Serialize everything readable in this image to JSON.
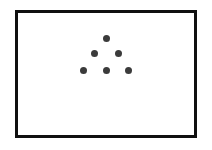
{
  "figure": {
    "background_color": "#ffffff",
    "frame": {
      "border_color": "#101010",
      "border_width_px": 3,
      "x": 15,
      "y": 10,
      "width": 182,
      "height": 128,
      "fill_color": "#ffffff"
    },
    "dot_color": "#3b3b3b",
    "dot_diameter_px": 7,
    "dot_count": 6,
    "rows": [
      {
        "label": "top-row",
        "count": 1
      },
      {
        "label": "middle-row",
        "count": 2
      },
      {
        "label": "bottom-row",
        "count": 3
      }
    ],
    "dots": [
      {
        "id": "dot-1",
        "row": "top-row",
        "index": 1,
        "cx": 106,
        "cy": 38
      },
      {
        "id": "dot-2",
        "row": "middle-row",
        "index": 1,
        "cx": 94,
        "cy": 53
      },
      {
        "id": "dot-3",
        "row": "middle-row",
        "index": 2,
        "cx": 118,
        "cy": 53
      },
      {
        "id": "dot-4",
        "row": "bottom-row",
        "index": 1,
        "cx": 83,
        "cy": 70
      },
      {
        "id": "dot-5",
        "row": "bottom-row",
        "index": 2,
        "cx": 106,
        "cy": 70
      },
      {
        "id": "dot-6",
        "row": "bottom-row",
        "index": 3,
        "cx": 128,
        "cy": 70
      }
    ]
  }
}
